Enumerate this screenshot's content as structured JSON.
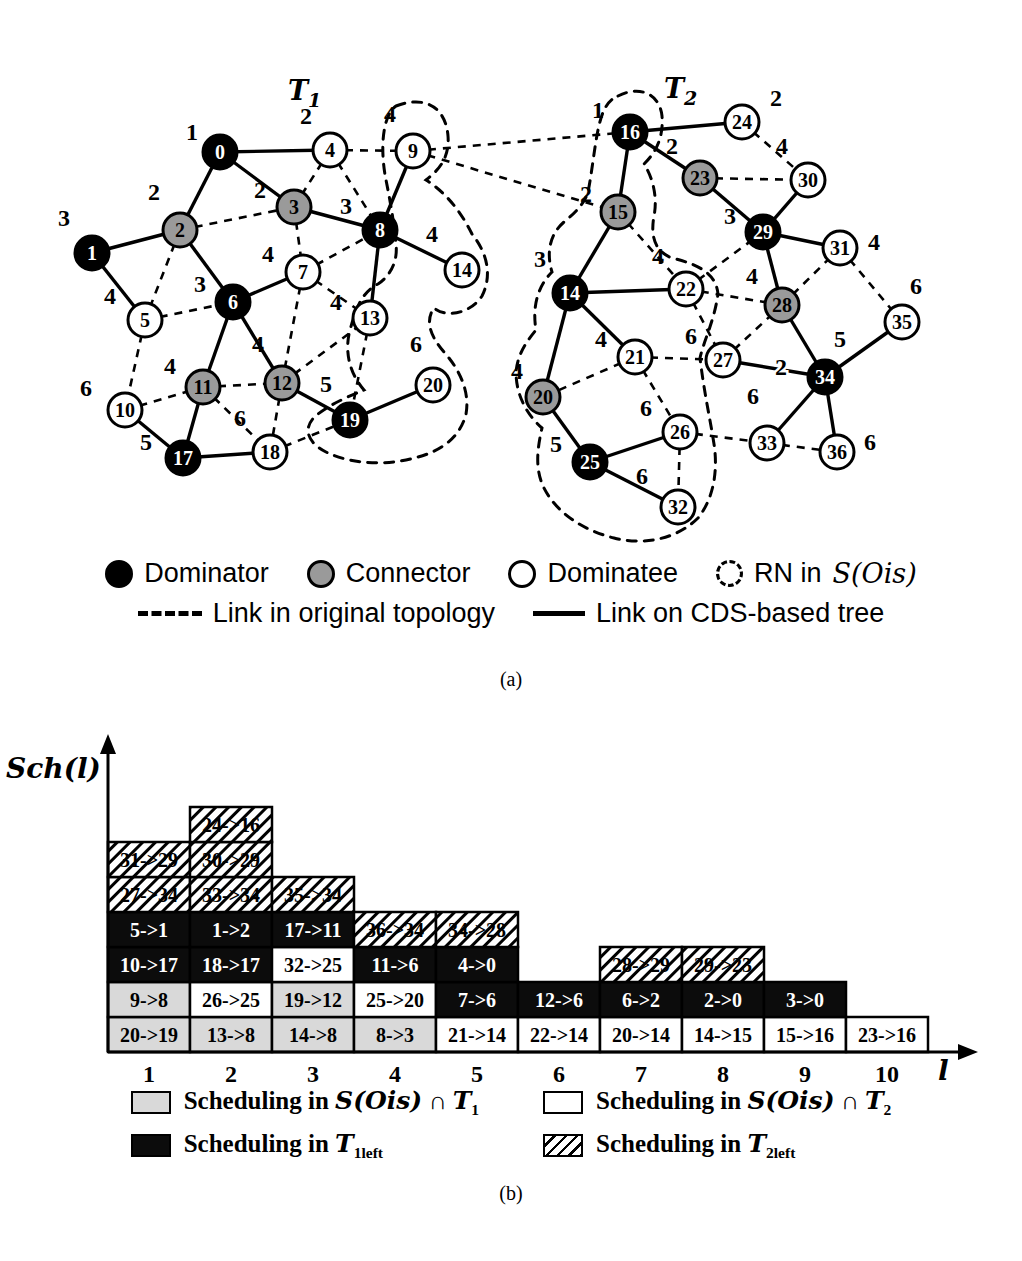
{
  "caption_a": "(a)",
  "caption_b": "(b)",
  "titles": {
    "tree1": {
      "main": "T",
      "sub": "1",
      "x": 288,
      "y": 100
    },
    "tree2": {
      "main": "T",
      "sub": "2",
      "x": 664,
      "y": 98
    }
  },
  "graph": {
    "nodes": [
      {
        "key": "t1-0",
        "id": "0",
        "type": "dominator",
        "level": "1",
        "x": 220,
        "y": 152,
        "lx": -28,
        "ly": -12
      },
      {
        "key": "t1-4",
        "id": "4",
        "type": "dominatee",
        "level": "2",
        "x": 330,
        "y": 150,
        "lx": -24,
        "ly": -26
      },
      {
        "key": "t1-9",
        "id": "9",
        "type": "dominatee",
        "level": "4",
        "x": 413,
        "y": 151,
        "lx": -23,
        "ly": -29
      },
      {
        "key": "t1-2",
        "id": "2",
        "type": "connector",
        "level": "2",
        "x": 180,
        "y": 230,
        "lx": -26,
        "ly": -30
      },
      {
        "key": "t1-3",
        "id": "3",
        "type": "connector",
        "level": "2",
        "x": 294,
        "y": 207,
        "lx": -34,
        "ly": -9
      },
      {
        "key": "t1-8",
        "id": "8",
        "type": "dominator",
        "level": "3",
        "x": 380,
        "y": 230,
        "lx": -34,
        "ly": -16
      },
      {
        "key": "t1-1",
        "id": "1",
        "type": "dominator",
        "level": "3",
        "x": 92,
        "y": 253,
        "lx": -28,
        "ly": -27
      },
      {
        "key": "t1-5",
        "id": "5",
        "type": "dominatee",
        "level": "4",
        "x": 145,
        "y": 320,
        "lx": -35,
        "ly": -16
      },
      {
        "key": "t1-6",
        "id": "6",
        "type": "dominator",
        "level": "3",
        "x": 233,
        "y": 302,
        "lx": -33,
        "ly": -10
      },
      {
        "key": "t1-7",
        "id": "7",
        "type": "dominatee",
        "level": "4",
        "x": 303,
        "y": 272,
        "lx": -35,
        "ly": -10
      },
      {
        "key": "t1-13",
        "id": "13",
        "type": "dominatee",
        "level": "4",
        "x": 370,
        "y": 318,
        "lx": -34,
        "ly": -8
      },
      {
        "key": "t1-14",
        "id": "14",
        "type": "dominatee",
        "level": "4",
        "x": 462,
        "y": 270,
        "lx": -30,
        "ly": -28
      },
      {
        "key": "t1-11",
        "id": "11",
        "type": "connector",
        "level": "4",
        "x": 203,
        "y": 387,
        "lx": -33,
        "ly": -13
      },
      {
        "key": "t1-12",
        "id": "12",
        "type": "connector",
        "level": "4",
        "x": 282,
        "y": 383,
        "lx": -24,
        "ly": -31
      },
      {
        "key": "t1-10",
        "id": "10",
        "type": "dominatee",
        "level": "6",
        "x": 125,
        "y": 410,
        "lx": -39,
        "ly": -14
      },
      {
        "key": "t1-19",
        "id": "19",
        "type": "dominator",
        "level": "5",
        "x": 350,
        "y": 420,
        "lx": -24,
        "ly": -28
      },
      {
        "key": "t1-20",
        "id": "20",
        "type": "dominatee",
        "level": "6",
        "x": 433,
        "y": 385,
        "lx": -17,
        "ly": -33
      },
      {
        "key": "t1-17",
        "id": "17",
        "type": "dominator",
        "level": "5",
        "x": 183,
        "y": 458,
        "lx": -37,
        "ly": -8
      },
      {
        "key": "t1-18",
        "id": "18",
        "type": "dominatee",
        "level": "6",
        "x": 270,
        "y": 452,
        "lx": -30,
        "ly": -26
      },
      {
        "key": "t2-16",
        "id": "16",
        "type": "dominator",
        "level": "1",
        "x": 630,
        "y": 132,
        "lx": -32,
        "ly": -14
      },
      {
        "key": "t2-24",
        "id": "24",
        "type": "dominatee",
        "level": "2",
        "x": 742,
        "y": 122,
        "lx": 34,
        "ly": -16
      },
      {
        "key": "t2-23",
        "id": "23",
        "type": "connector",
        "level": "2",
        "x": 700,
        "y": 178,
        "lx": -28,
        "ly": -24
      },
      {
        "key": "t2-30",
        "id": "30",
        "type": "dominatee",
        "level": "4",
        "x": 808,
        "y": 180,
        "lx": -26,
        "ly": -26
      },
      {
        "key": "t2-15",
        "id": "15",
        "type": "connector",
        "level": "2",
        "x": 618,
        "y": 212,
        "lx": -32,
        "ly": -10
      },
      {
        "key": "t2-29",
        "id": "29",
        "type": "dominator",
        "level": "3",
        "x": 763,
        "y": 232,
        "lx": -33,
        "ly": -8
      },
      {
        "key": "t2-31",
        "id": "31",
        "type": "dominatee",
        "level": "4",
        "x": 840,
        "y": 248,
        "lx": 34,
        "ly": 2
      },
      {
        "key": "t2-14",
        "id": "14",
        "type": "dominator",
        "level": "3",
        "x": 570,
        "y": 293,
        "lx": -30,
        "ly": -26
      },
      {
        "key": "t2-22",
        "id": "22",
        "type": "dominatee",
        "level": "4",
        "x": 686,
        "y": 289,
        "lx": -28,
        "ly": -25
      },
      {
        "key": "t2-28",
        "id": "28",
        "type": "connector",
        "level": "4",
        "x": 782,
        "y": 305,
        "lx": -30,
        "ly": -21
      },
      {
        "key": "t2-35",
        "id": "35",
        "type": "dominatee",
        "level": "6",
        "x": 902,
        "y": 322,
        "lx": 14,
        "ly": -28
      },
      {
        "key": "t2-21",
        "id": "21",
        "type": "dominatee",
        "level": "4",
        "x": 635,
        "y": 357,
        "lx": -34,
        "ly": -10
      },
      {
        "key": "t2-27",
        "id": "27",
        "type": "dominatee",
        "level": "6",
        "x": 723,
        "y": 360,
        "lx": -32,
        "ly": -16
      },
      {
        "key": "t2-34",
        "id": "34",
        "type": "dominator",
        "level": "5",
        "x": 825,
        "y": 377,
        "lx": 15,
        "ly": -30
      },
      {
        "key": "t2-20",
        "id": "20",
        "type": "connector",
        "level": "4",
        "x": 543,
        "y": 397,
        "lx": -26,
        "ly": -18
      },
      {
        "key": "t2-26",
        "id": "26",
        "type": "dominatee",
        "level": "6",
        "x": 680,
        "y": 432,
        "lx": -34,
        "ly": -16
      },
      {
        "key": "t2-33",
        "id": "33",
        "type": "dominatee",
        "level": "6",
        "x": 767,
        "y": 443,
        "lx": -14,
        "ly": -39
      },
      {
        "key": "t2-36",
        "id": "36",
        "type": "dominatee",
        "level": "6",
        "x": 837,
        "y": 452,
        "lx": 33,
        "ly": -2
      },
      {
        "key": "t2-25",
        "id": "25",
        "type": "dominator",
        "level": "5",
        "x": 590,
        "y": 462,
        "lx": -34,
        "ly": -10
      },
      {
        "key": "t2-32",
        "id": "32",
        "type": "dominatee",
        "level": "6",
        "x": 678,
        "y": 507,
        "lx": -36,
        "ly": -23
      }
    ],
    "solid_edges": [
      [
        "t1-0",
        "t1-4"
      ],
      [
        "t1-0",
        "t1-2"
      ],
      [
        "t1-0",
        "t1-3"
      ],
      [
        "t1-2",
        "t1-1"
      ],
      [
        "t1-1",
        "t1-5"
      ],
      [
        "t1-2",
        "t1-6"
      ],
      [
        "t1-3",
        "t1-8"
      ],
      [
        "t1-8",
        "t1-9"
      ],
      [
        "t1-8",
        "t1-13"
      ],
      [
        "t1-8",
        "t1-14"
      ],
      [
        "t1-6",
        "t1-7"
      ],
      [
        "t1-6",
        "t1-11"
      ],
      [
        "t1-6",
        "t1-12"
      ],
      [
        "t1-11",
        "t1-17"
      ],
      [
        "t1-17",
        "t1-10"
      ],
      [
        "t1-17",
        "t1-18"
      ],
      [
        "t1-12",
        "t1-19"
      ],
      [
        "t1-19",
        "t1-20"
      ],
      [
        "t2-16",
        "t2-24"
      ],
      [
        "t2-16",
        "t2-23"
      ],
      [
        "t2-16",
        "t2-15"
      ],
      [
        "t2-23",
        "t2-29"
      ],
      [
        "t2-29",
        "t2-30"
      ],
      [
        "t2-29",
        "t2-31"
      ],
      [
        "t2-29",
        "t2-28"
      ],
      [
        "t2-15",
        "t2-14"
      ],
      [
        "t2-14",
        "t2-21"
      ],
      [
        "t2-14",
        "t2-22"
      ],
      [
        "t2-14",
        "t2-20"
      ],
      [
        "t2-28",
        "t2-34"
      ],
      [
        "t2-20",
        "t2-25"
      ],
      [
        "t2-34",
        "t2-27"
      ],
      [
        "t2-34",
        "t2-33"
      ],
      [
        "t2-34",
        "t2-35"
      ],
      [
        "t2-34",
        "t2-36"
      ],
      [
        "t2-25",
        "t2-26"
      ],
      [
        "t2-25",
        "t2-32"
      ]
    ],
    "dashed_edges": [
      [
        "t1-2",
        "t1-3"
      ],
      [
        "t1-2",
        "t1-5"
      ],
      [
        "t1-5",
        "t1-6"
      ],
      [
        "t1-5",
        "t1-10"
      ],
      [
        "t1-10",
        "t1-11"
      ],
      [
        "t1-11",
        "t1-12"
      ],
      [
        "t1-11",
        "t1-18"
      ],
      [
        "t1-12",
        "t1-18"
      ],
      [
        "t1-12",
        "t1-13"
      ],
      [
        "t1-18",
        "t1-19"
      ],
      [
        "t1-13",
        "t1-19"
      ],
      [
        "t1-3",
        "t1-7"
      ],
      [
        "t1-7",
        "t1-8"
      ],
      [
        "t1-7",
        "t1-13"
      ],
      [
        "t1-7",
        "t1-12"
      ],
      [
        "t1-4",
        "t1-3"
      ],
      [
        "t1-4",
        "t1-8"
      ],
      [
        "t1-4",
        "t1-9"
      ],
      [
        "t1-9",
        "t2-16"
      ],
      [
        "t1-9",
        "t2-15"
      ],
      [
        "t2-24",
        "t2-30"
      ],
      [
        "t2-23",
        "t2-30"
      ],
      [
        "t2-15",
        "t2-22"
      ],
      [
        "t2-22",
        "t2-29"
      ],
      [
        "t2-22",
        "t2-28"
      ],
      [
        "t2-22",
        "t2-27"
      ],
      [
        "t2-28",
        "t2-31"
      ],
      [
        "t2-27",
        "t2-28"
      ],
      [
        "t2-31",
        "t2-35"
      ],
      [
        "t2-21",
        "t2-20"
      ],
      [
        "t2-21",
        "t2-26"
      ],
      [
        "t2-21",
        "t2-27"
      ],
      [
        "t2-26",
        "t2-33"
      ],
      [
        "t2-26",
        "t2-32"
      ],
      [
        "t2-33",
        "t2-36"
      ]
    ],
    "rn_regions": [
      "M 396,106 C 428,94 446,110 448,136 C 450,160 436,172 426,180 C 448,194 462,214 472,234 C 488,254 492,276 482,296 C 470,314 446,318 434,308 C 424,322 432,338 444,352 C 460,370 470,392 466,414 C 460,438 440,452 414,458 C 386,466 350,464 326,452 C 306,442 302,426 318,414 C 334,402 350,396 364,390 C 350,374 344,352 350,330 C 356,308 362,292 378,284 C 390,276 398,262 396,244 C 394,222 390,200 386,180 C 380,150 382,116 396,106 Z",
      "M 618,96 C 642,84 660,96 662,116 C 664,142 652,156 644,164 C 652,176 658,196 654,216 C 650,238 656,252 672,258 C 696,264 716,272 718,294 C 714,322 704,340 700,358 C 704,392 710,418 714,444 C 718,470 714,498 698,518 C 678,538 646,546 614,538 C 582,530 556,512 544,488 C 534,468 538,446 542,428 C 526,414 516,394 516,372 C 518,352 528,340 536,330 C 532,306 538,286 552,272 C 546,252 550,234 564,222 C 576,212 584,204 588,192 C 592,172 594,150 598,130 C 602,110 608,100 618,96 Z"
    ],
    "edge_labels": [
      {
        "text": "2",
        "x": 781,
        "y": 375
      }
    ]
  },
  "legend_a": {
    "items": [
      {
        "symbol": "dominator-swatch",
        "label": "Dominator"
      },
      {
        "symbol": "connector-swatch",
        "label": "Connector"
      },
      {
        "symbol": "dominatee-swatch",
        "label": "Dominatee"
      },
      {
        "symbol": "rn-swatch",
        "label": "RN in ",
        "script": "S(Ois)"
      }
    ],
    "line2": [
      {
        "symbol": "dashed-link",
        "label": "Link in original topology"
      },
      {
        "symbol": "solid-link",
        "label": "Link on CDS-based tree"
      }
    ]
  },
  "chart_data": {
    "type": "stacked-schedule",
    "ylabel": "Sch(l)",
    "xlabel": "l",
    "x_ticks": [
      "1",
      "2",
      "3",
      "4",
      "5",
      "6",
      "7",
      "8",
      "9",
      "10"
    ],
    "categories": {
      "s_t1": {
        "fill": "#d9d9d9",
        "text": "#000000"
      },
      "s_t2": {
        "fill": "#ffffff",
        "text": "#000000"
      },
      "t1left": {
        "fill": "#0c0c0c",
        "text": "#ffffff"
      },
      "t2left": {
        "fill": "hatch",
        "text": "#000000"
      }
    },
    "columns": [
      {
        "slot": "1",
        "cells": [
          {
            "label": "20->19",
            "cat": "s_t1"
          },
          {
            "label": "9->8",
            "cat": "s_t1"
          },
          {
            "label": "10->17",
            "cat": "t1left"
          },
          {
            "label": "5->1",
            "cat": "t1left"
          },
          {
            "label": "27->34",
            "cat": "t2left"
          },
          {
            "label": "31->29",
            "cat": "t2left"
          }
        ]
      },
      {
        "slot": "2",
        "cells": [
          {
            "label": "13->8",
            "cat": "s_t1"
          },
          {
            "label": "26->25",
            "cat": "s_t2"
          },
          {
            "label": "18->17",
            "cat": "t1left"
          },
          {
            "label": "1->2",
            "cat": "t1left"
          },
          {
            "label": "33->34",
            "cat": "t2left"
          },
          {
            "label": "30->29",
            "cat": "t2left"
          },
          {
            "label": "24->16",
            "cat": "t2left"
          }
        ]
      },
      {
        "slot": "3",
        "cells": [
          {
            "label": "14->8",
            "cat": "s_t1"
          },
          {
            "label": "19->12",
            "cat": "s_t1"
          },
          {
            "label": "32->25",
            "cat": "s_t2"
          },
          {
            "label": "17->11",
            "cat": "t1left"
          },
          {
            "label": "35->34",
            "cat": "t2left"
          }
        ]
      },
      {
        "slot": "4",
        "cells": [
          {
            "label": "8->3",
            "cat": "s_t1"
          },
          {
            "label": "25->20",
            "cat": "s_t2"
          },
          {
            "label": "11->6",
            "cat": "t1left"
          },
          {
            "label": "36->34",
            "cat": "t2left"
          }
        ]
      },
      {
        "slot": "5",
        "cells": [
          {
            "label": "21->14",
            "cat": "s_t2"
          },
          {
            "label": "7->6",
            "cat": "t1left"
          },
          {
            "label": "4->0",
            "cat": "t1left"
          },
          {
            "label": "34->28",
            "cat": "t2left"
          }
        ]
      },
      {
        "slot": "6",
        "cells": [
          {
            "label": "22->14",
            "cat": "s_t2"
          },
          {
            "label": "12->6",
            "cat": "t1left"
          }
        ]
      },
      {
        "slot": "7",
        "cells": [
          {
            "label": "20->14",
            "cat": "s_t2"
          },
          {
            "label": "6->2",
            "cat": "t1left"
          },
          {
            "label": "28->29",
            "cat": "t2left"
          }
        ]
      },
      {
        "slot": "8",
        "cells": [
          {
            "label": "14->15",
            "cat": "s_t2"
          },
          {
            "label": "2->0",
            "cat": "t1left"
          },
          {
            "label": "29->23",
            "cat": "t2left"
          }
        ]
      },
      {
        "slot": "9",
        "cells": [
          {
            "label": "15->16",
            "cat": "s_t2"
          },
          {
            "label": "3->0",
            "cat": "t1left"
          }
        ]
      },
      {
        "slot": "10",
        "cells": [
          {
            "label": "23->16",
            "cat": "s_t2"
          }
        ]
      }
    ],
    "legend": [
      {
        "cat": "s_t1",
        "segments": [
          [
            "b",
            "Scheduling in "
          ],
          [
            "scr",
            "S(Ois)"
          ],
          [
            "b",
            " ∩ "
          ],
          [
            "scr",
            "T"
          ],
          [
            "sub",
            "1"
          ]
        ]
      },
      {
        "cat": "s_t2",
        "segments": [
          [
            "b",
            "Scheduling in "
          ],
          [
            "scr",
            "S(Ois)"
          ],
          [
            "b",
            " ∩ "
          ],
          [
            "scr",
            "T"
          ],
          [
            "sub",
            "2"
          ]
        ]
      },
      {
        "cat": "t1left",
        "segments": [
          [
            "b",
            "Scheduling in "
          ],
          [
            "scr",
            "T"
          ],
          [
            "sub",
            "1left"
          ]
        ]
      },
      {
        "cat": "t2left",
        "segments": [
          [
            "b",
            "Scheduling in "
          ],
          [
            "scr",
            "T"
          ],
          [
            "sub",
            "2left"
          ]
        ]
      }
    ]
  }
}
